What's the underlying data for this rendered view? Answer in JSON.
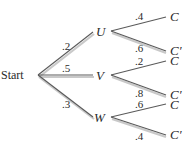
{
  "diagram": {
    "type": "probability-tree",
    "root": {
      "label": "Start"
    },
    "level1": [
      {
        "label": "U",
        "prob": ".2"
      },
      {
        "label": "V",
        "prob": ".5"
      },
      {
        "label": "W",
        "prob": ".3"
      }
    ],
    "level2": [
      {
        "parent": "U",
        "label": "C",
        "prob": ".4"
      },
      {
        "parent": "U",
        "label": "C′",
        "prob": ".6"
      },
      {
        "parent": "V",
        "label": "C",
        "prob": ".2"
      },
      {
        "parent": "V",
        "label": "C′",
        "prob": ".8"
      },
      {
        "parent": "W",
        "label": "C",
        "prob": ".6"
      },
      {
        "parent": "W",
        "label": "C′",
        "prob": ".4"
      }
    ],
    "colors": {
      "line": "#5a5a5a",
      "shadow": "#c9c9c9",
      "text": "#2a2a2a"
    }
  }
}
